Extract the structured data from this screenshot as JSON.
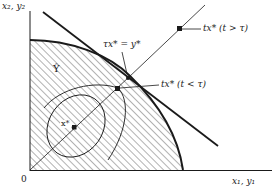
{
  "diagram": {
    "axes": {
      "y_label": "x₂, y₂",
      "x_label": "x₁, y₁",
      "origin_label": "0"
    },
    "region_label": "Ŷ",
    "annotations": {
      "tangent_point": "τx* = y*",
      "outer_point": "tx* (t > τ)",
      "inner_point": "tx* (t < τ)",
      "center_point": "x*"
    },
    "colors": {
      "ink": "#1a1a1a",
      "background": "#ffffff",
      "hatch": "#555555"
    }
  }
}
